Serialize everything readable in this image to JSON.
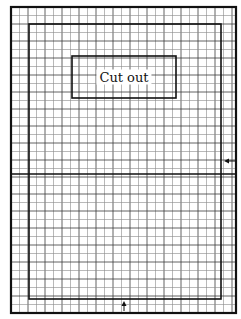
{
  "diagram": {
    "type": "grid-template",
    "colors": {
      "background": "#ffffff",
      "grid_minor": "#8a8a8a",
      "grid_major": "#3a3a3a",
      "border": "#111111"
    },
    "grid": {
      "x0": 11,
      "y0": 7,
      "x1": 236,
      "y1": 313,
      "spacing": 8.5
    },
    "outer_border": {
      "x": 11,
      "y": 7,
      "w": 225,
      "h": 306,
      "stroke": 2.2
    },
    "inner_border": {
      "x": 29,
      "y": 24,
      "w": 192,
      "h": 275,
      "stroke": 1.6
    },
    "midline_y": 174,
    "cutout": {
      "x": 72,
      "y": 56,
      "w": 104,
      "h": 42,
      "label": "Cut out"
    },
    "markers": [
      {
        "name": "right-edge-marker",
        "direction": "left",
        "x": 232,
        "y": 161
      },
      {
        "name": "bottom-edge-marker",
        "direction": "up",
        "x": 124,
        "y": 306
      }
    ]
  }
}
